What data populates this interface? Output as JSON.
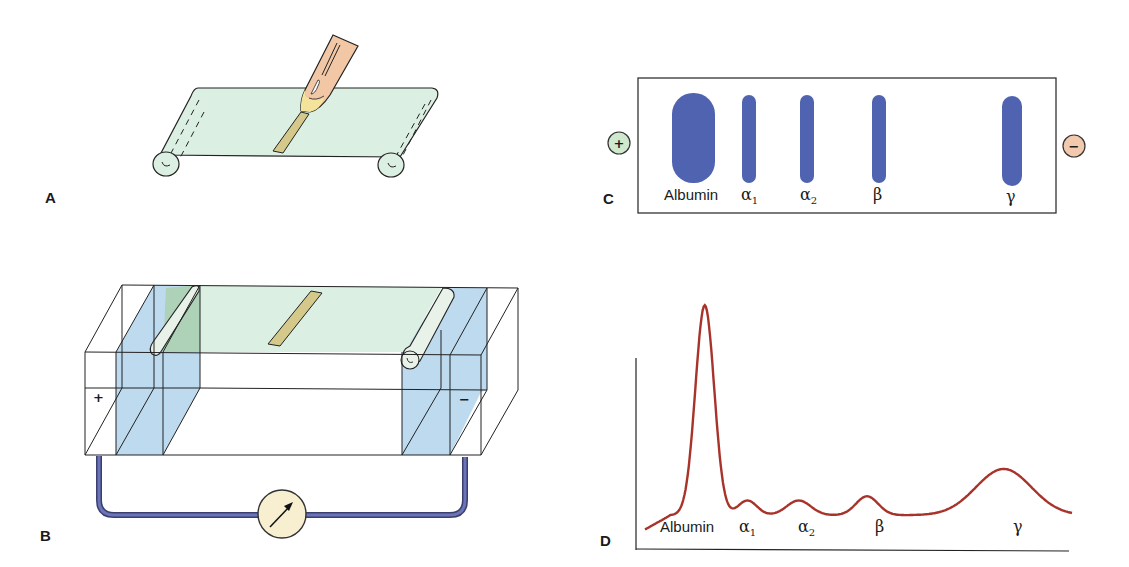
{
  "panels": {
    "a": {
      "label": "A",
      "description": "Sample applied to cellulose acetate strip"
    },
    "b": {
      "label": "B",
      "description": "Electrophoresis chamber with buffer and electrodes",
      "anode_sign": "+",
      "cathode_sign": "−",
      "meter_icon": "voltmeter-arrow"
    },
    "c": {
      "label": "C",
      "description": "Stained separated protein bands",
      "anode_sign": "+",
      "cathode_sign": "−",
      "bands": [
        {
          "name": "Albumin",
          "symbol": "Albumin",
          "sub": ""
        },
        {
          "name": "alpha-1",
          "symbol": "α",
          "sub": "1"
        },
        {
          "name": "alpha-2",
          "symbol": "α",
          "sub": "2"
        },
        {
          "name": "beta",
          "symbol": "β",
          "sub": ""
        },
        {
          "name": "gamma",
          "symbol": "γ",
          "sub": ""
        }
      ]
    },
    "d": {
      "label": "D",
      "description": "Densitometer scan"
    }
  },
  "colors": {
    "strip": "#dcefe3",
    "buffer": "#b9d8ee",
    "band": "#4f63b0",
    "sample": "#d4c98a",
    "pipette": "#f2c7a6",
    "wire": "#5660a0",
    "meter": "#f7efcf",
    "curve": "#a8332a",
    "anode": "#cfe9cf",
    "cathode": "#f3c9ad"
  },
  "chart_data": {
    "type": "line",
    "xlabel": "",
    "ylabel": "",
    "x_labels": [
      "Albumin",
      "α1",
      "α2",
      "β",
      "γ"
    ],
    "x": [
      0,
      5,
      10,
      15,
      20,
      25,
      30,
      35,
      40,
      45,
      50,
      55,
      60,
      65,
      70,
      75,
      80,
      85,
      90,
      95,
      100
    ],
    "peaks": [
      {
        "name": "Albumin",
        "x": 14,
        "relative_height": 1.0
      },
      {
        "name": "α1",
        "x": 24,
        "relative_height": 0.07
      },
      {
        "name": "α2",
        "x": 36,
        "relative_height": 0.07
      },
      {
        "name": "β",
        "x": 52,
        "relative_height": 0.09
      },
      {
        "name": "γ",
        "x": 84,
        "relative_height": 0.22
      }
    ],
    "ylim": [
      0,
      1.1
    ],
    "grid": false
  }
}
